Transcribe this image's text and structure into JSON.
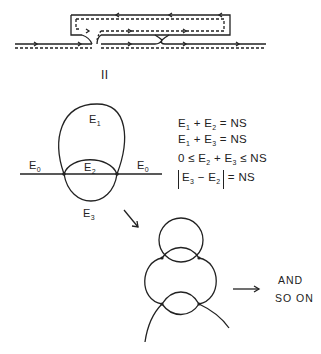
{
  "figure_top": {
    "label": "II"
  },
  "figure_middle": {
    "labels": {
      "e1": {
        "base": "E",
        "sub": "1"
      },
      "e2": {
        "base": "E",
        "sub": "2"
      },
      "e3": {
        "base": "E",
        "sub": "3"
      },
      "e0_left": {
        "base": "E",
        "sub": "0"
      },
      "e0_right": {
        "base": "E",
        "sub": "0"
      }
    }
  },
  "equations": [
    {
      "parts": [
        "E",
        "1",
        " + E",
        "2",
        " = NS"
      ]
    },
    {
      "parts": [
        "E",
        "1",
        " + E",
        "3",
        " = NS"
      ]
    },
    {
      "parts": [
        "0 ≤ E",
        "2",
        " + E",
        "3",
        " ≤ NS"
      ]
    },
    {
      "parts": [
        "E",
        "3",
        " − E",
        "2",
        "",
        " = NS"
      ]
    }
  ],
  "caption": {
    "line1": "AND",
    "line2": "SO ON"
  },
  "colors": {
    "ink": "#222222",
    "background": "#ffffff"
  }
}
